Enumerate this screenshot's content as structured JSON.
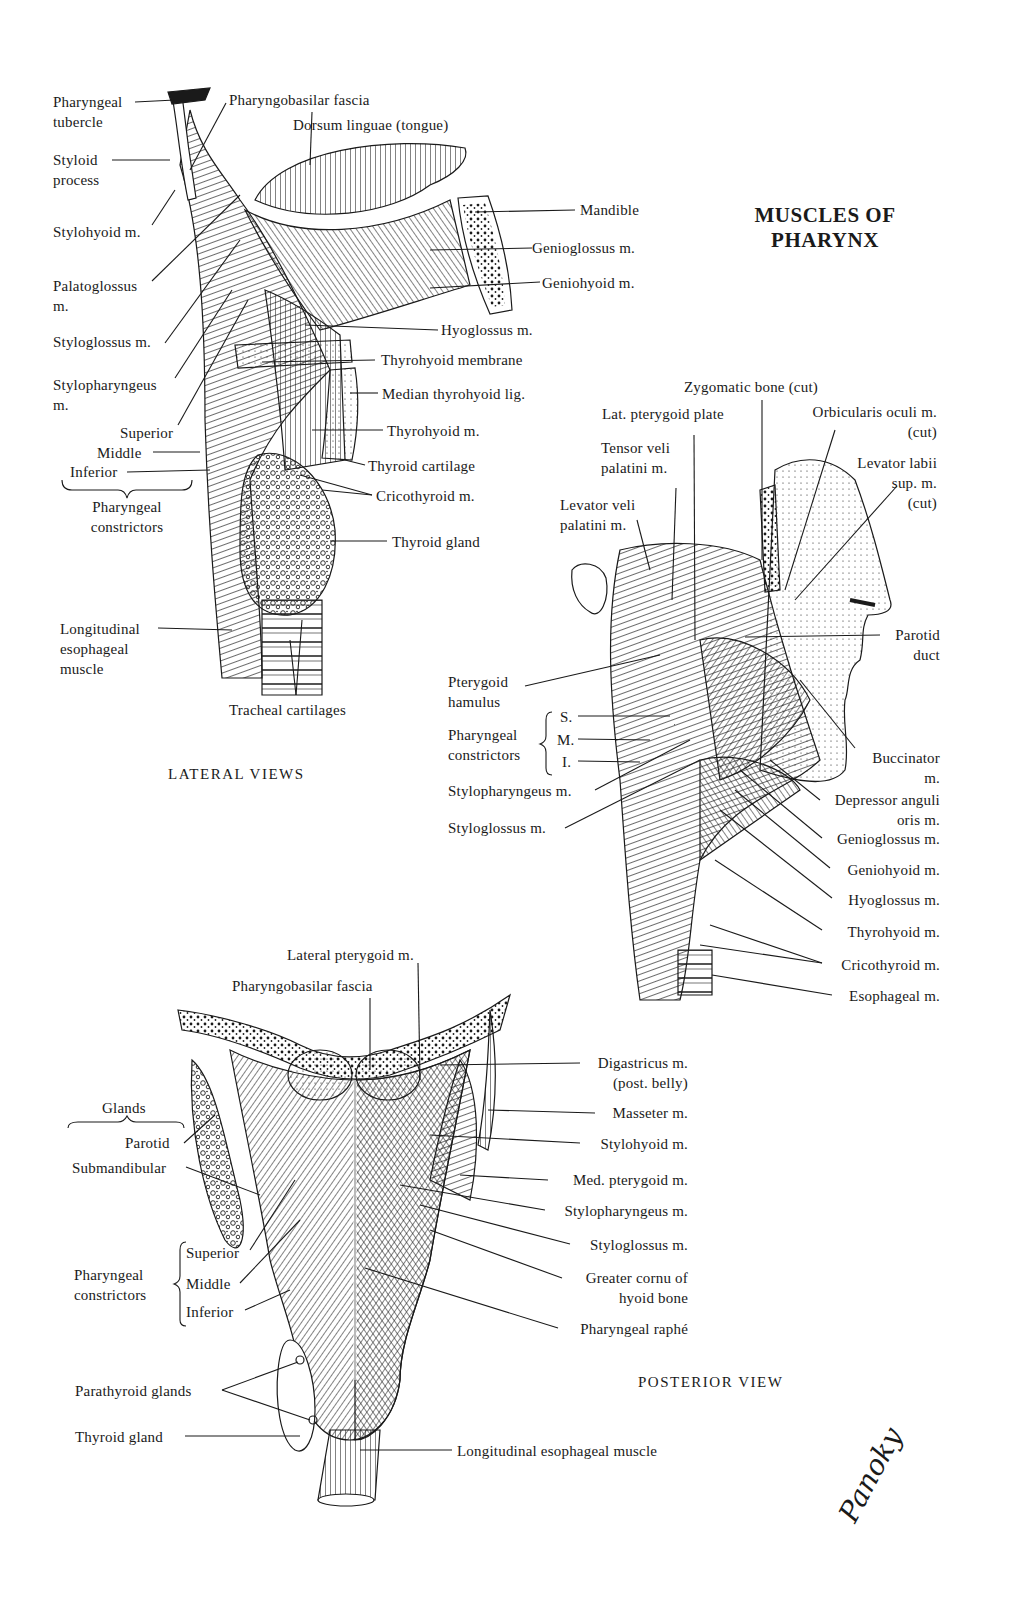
{
  "title": {
    "line1": "MUSCLES OF",
    "line2": "PHARYNX"
  },
  "lateral_views": {
    "caption": "LATERAL VIEWS",
    "left_labels": [
      "Pharyngeal\ntubercle",
      "Styloid\nprocess",
      "Stylohyoid m.",
      "Palatoglossus\nm.",
      "Styloglossus m.",
      "Stylopharyngeus\nm.",
      "Superior",
      "Middle",
      "Inferior",
      "Pharyngeal\nconstrictors",
      "Longitudinal\nesophageal\nmuscle"
    ],
    "top_labels": [
      "Pharyngobasilar fascia",
      "Dorsum linguae (tongue)"
    ],
    "right_labels": [
      "Mandible",
      "Genioglossus m.",
      "Geniohyoid m.",
      "Hyoglossus m.",
      "Thyrohyoid membrane",
      "Median thyrohyoid lig.",
      "Thyrohyoid m.",
      "Thyroid cartilage",
      "Cricothyroid m.",
      "Thyroid gland"
    ],
    "bottom_labels": [
      "Tracheal cartilages"
    ]
  },
  "face_view": {
    "top_labels": [
      "Zygomatic bone (cut)",
      "Lat. pterygoid plate",
      "Orbicularis oculi m.\n(cut)",
      "Tensor veli\npalatini m.",
      "Levator labii\nsup. m.\n(cut)",
      "Levator veli\npalatini m."
    ],
    "left_labels": [
      "Pterygoid\nhamulus",
      "Pharyngeal\nconstrictors",
      "S.",
      "M.",
      "I.",
      "Stylopharyngeus m.",
      "Styloglossus m."
    ],
    "right_labels": [
      "Parotid\nduct",
      "Buccinator\nm.",
      "Depressor anguli\noris m.",
      "Genioglossus m.",
      "Geniohyoid m.",
      "Hyoglossus m.",
      "Thyrohyoid m.",
      "Cricothyroid m.",
      "Esophageal m."
    ]
  },
  "posterior_view": {
    "caption": "POSTERIOR VIEW",
    "top_labels": [
      "Lateral pterygoid m.",
      "Pharyngobasilar fascia"
    ],
    "left_labels": [
      "Glands",
      "Parotid",
      "Submandibular",
      "Pharyngeal\nconstrictors",
      "Superior",
      "Middle",
      "Inferior",
      "Parathyroid glands",
      "Thyroid gland"
    ],
    "right_labels": [
      "Digastricus m.\n(post. belly)",
      "Masseter m.",
      "Stylohyoid m.",
      "Med. pterygoid m.",
      "Stylopharyngeus m.",
      "Styloglossus m.",
      "Greater cornu of\nhyoid bone",
      "Pharyngeal raphé"
    ],
    "bottom_labels": [
      "Longitudinal esophageal muscle"
    ]
  },
  "signature": "Panoky",
  "colors": {
    "ink": "#1a1a1a",
    "paper": "#ffffff"
  }
}
